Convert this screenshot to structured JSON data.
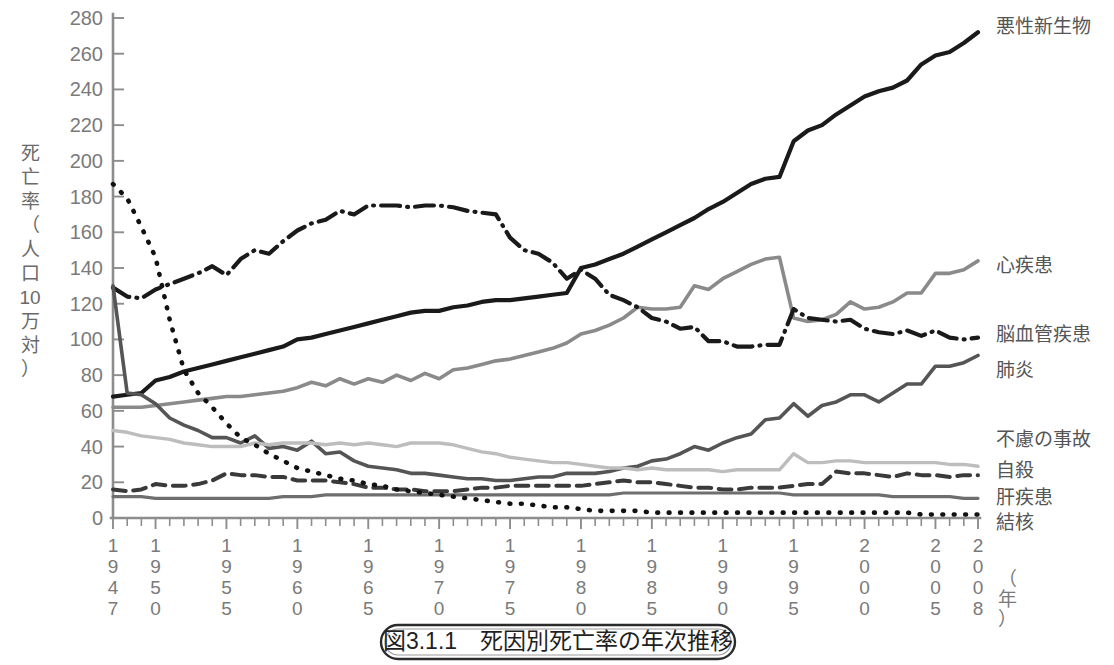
{
  "caption": "図3.1.1　死因別死亡率の年次推移",
  "axes": {
    "ylabel": "死亡率（人口10万対）",
    "ylabel_chars": [
      "死",
      "亡",
      "率",
      "（",
      "人",
      "口",
      "10",
      "万",
      "対",
      "）"
    ],
    "xlabel": "（年）",
    "ylim": [
      0,
      280
    ],
    "ytick_step": 20,
    "yticks": [
      "0",
      "20",
      "40",
      "60",
      "80",
      "100",
      "120",
      "140",
      "160",
      "180",
      "200",
      "220",
      "240",
      "260",
      "280"
    ],
    "xlim": [
      1947,
      2008
    ],
    "xticks": [
      "1947",
      "1950",
      "1955",
      "1960",
      "1965",
      "1970",
      "1975",
      "1980",
      "1985",
      "1990",
      "1995",
      "2000",
      "2005",
      "2008"
    ],
    "grid": false
  },
  "chart_data": {
    "type": "line",
    "title": "図3.1.1　死因別死亡率の年次推移",
    "xlabel": "（年）",
    "ylabel": "死亡率（人口10万対）",
    "xlim": [
      1947,
      2008
    ],
    "ylim": [
      0,
      280
    ],
    "legend_position": "right-inline",
    "x": [
      1947,
      1948,
      1949,
      1950,
      1951,
      1952,
      1953,
      1954,
      1955,
      1956,
      1957,
      1958,
      1959,
      1960,
      1961,
      1962,
      1963,
      1964,
      1965,
      1966,
      1967,
      1968,
      1969,
      1970,
      1971,
      1972,
      1973,
      1974,
      1975,
      1976,
      1977,
      1978,
      1979,
      1980,
      1981,
      1982,
      1983,
      1984,
      1985,
      1986,
      1987,
      1988,
      1989,
      1990,
      1991,
      1992,
      1993,
      1994,
      1995,
      1996,
      1997,
      1998,
      1999,
      2000,
      2001,
      2002,
      2003,
      2004,
      2005,
      2006,
      2007,
      2008
    ],
    "series": [
      {
        "name": "悪性新生物",
        "style": "solid",
        "color": "#1a1a1a",
        "width": 4.2,
        "values": [
          68,
          69,
          70,
          77,
          79,
          82,
          84,
          86,
          88,
          90,
          92,
          94,
          96,
          100,
          101,
          103,
          105,
          107,
          109,
          111,
          113,
          115,
          116,
          116,
          118,
          119,
          121,
          122,
          122,
          123,
          124,
          125,
          126,
          140,
          142,
          145,
          148,
          152,
          156,
          160,
          164,
          168,
          173,
          177,
          182,
          187,
          190,
          191,
          211,
          217,
          220,
          226,
          231,
          236,
          239,
          241,
          245,
          254,
          259,
          261,
          266,
          272
        ]
      },
      {
        "name": "心疾患",
        "style": "solid",
        "color": "#8a8a8a",
        "width": 3.6,
        "values": [
          62,
          62,
          62,
          63,
          64,
          65,
          66,
          67,
          68,
          68,
          69,
          70,
          71,
          73,
          76,
          74,
          78,
          75,
          78,
          76,
          80,
          77,
          81,
          78,
          83,
          84,
          86,
          88,
          89,
          91,
          93,
          95,
          98,
          103,
          105,
          108,
          112,
          118,
          117,
          117,
          118,
          130,
          128,
          134,
          138,
          142,
          145,
          146,
          112,
          110,
          111,
          114,
          121,
          117,
          118,
          121,
          126,
          126,
          137,
          137,
          139,
          144
        ]
      },
      {
        "name": "脳血管疾患",
        "style": "dashdot",
        "color": "#1a1a1a",
        "width": 4.2,
        "values": [
          129,
          124,
          123,
          128,
          131,
          134,
          137,
          141,
          136,
          145,
          150,
          148,
          155,
          161,
          165,
          167,
          172,
          170,
          175,
          175,
          175,
          174,
          175,
          175,
          174,
          172,
          171,
          170,
          157,
          150,
          148,
          143,
          134,
          139,
          134,
          125,
          122,
          118,
          112,
          110,
          106,
          107,
          99,
          99,
          96,
          96,
          97,
          97,
          117,
          112,
          111,
          110,
          111,
          106,
          104,
          103,
          105,
          102,
          105,
          101,
          100,
          101
        ]
      },
      {
        "name": "肺炎",
        "style": "solid",
        "color": "#555555",
        "width": 3.6,
        "values": [
          130,
          70,
          69,
          64,
          56,
          52,
          49,
          45,
          45,
          42,
          46,
          39,
          40,
          38,
          43,
          36,
          37,
          32,
          29,
          28,
          27,
          25,
          25,
          24,
          23,
          22,
          22,
          21,
          21,
          22,
          23,
          23,
          25,
          25,
          25,
          26,
          28,
          29,
          32,
          33,
          36,
          40,
          38,
          42,
          45,
          47,
          55,
          56,
          64,
          57,
          63,
          65,
          69,
          69,
          65,
          70,
          75,
          75,
          85,
          85,
          87,
          91
        ]
      },
      {
        "name": "不慮の事故",
        "style": "solid",
        "color": "#bdbdbd",
        "width": 3.4,
        "values": [
          49,
          48,
          46,
          45,
          44,
          42,
          41,
          40,
          40,
          40,
          42,
          41,
          42,
          42,
          42,
          41,
          42,
          41,
          42,
          41,
          40,
          42,
          42,
          42,
          41,
          39,
          37,
          36,
          34,
          33,
          32,
          31,
          31,
          30,
          29,
          28,
          28,
          27,
          28,
          27,
          27,
          27,
          27,
          26,
          27,
          27,
          27,
          27,
          36,
          31,
          31,
          32,
          32,
          31,
          31,
          31,
          31,
          31,
          31,
          30,
          30,
          29
        ]
      },
      {
        "name": "自殺",
        "style": "dashed",
        "color": "#3a3a3a",
        "width": 4.0,
        "values": [
          16,
          15,
          16,
          19,
          18,
          18,
          19,
          21,
          25,
          24,
          24,
          23,
          23,
          21,
          21,
          21,
          20,
          19,
          17,
          17,
          16,
          16,
          15,
          15,
          15,
          16,
          17,
          17,
          18,
          18,
          18,
          18,
          18,
          18,
          19,
          20,
          21,
          20,
          20,
          19,
          18,
          17,
          17,
          16,
          16,
          17,
          17,
          17,
          18,
          19,
          19,
          26,
          25,
          25,
          24,
          23,
          25,
          24,
          24,
          23,
          24,
          24
        ]
      },
      {
        "name": "肝疾患",
        "style": "solid",
        "color": "#6e6e6e",
        "width": 3.2,
        "values": [
          12,
          12,
          12,
          11,
          11,
          11,
          11,
          11,
          11,
          11,
          11,
          11,
          12,
          12,
          12,
          13,
          13,
          13,
          13,
          13,
          13,
          13,
          13,
          13,
          13,
          13,
          13,
          13,
          13,
          13,
          13,
          13,
          13,
          13,
          13,
          13,
          14,
          14,
          14,
          14,
          14,
          14,
          14,
          14,
          14,
          14,
          14,
          14,
          13,
          13,
          13,
          13,
          13,
          13,
          13,
          12,
          12,
          12,
          12,
          12,
          11,
          11
        ]
      },
      {
        "name": "結核",
        "style": "dotted",
        "color": "#111111",
        "width": 4.6,
        "values": [
          187,
          179,
          163,
          146,
          111,
          83,
          70,
          62,
          53,
          45,
          41,
          36,
          32,
          28,
          26,
          24,
          22,
          21,
          19,
          18,
          16,
          15,
          14,
          13,
          12,
          11,
          10,
          9,
          8,
          8,
          7,
          6,
          6,
          5,
          4,
          4,
          4,
          4,
          3,
          3,
          3,
          3,
          3,
          3,
          3,
          3,
          3,
          3,
          3,
          3,
          3,
          3,
          3,
          3,
          3,
          3,
          3,
          2,
          2,
          2,
          2,
          2
        ]
      }
    ],
    "annotations": [
      {
        "label": "悪性新生物",
        "at_year": 2008,
        "at_value": 272
      },
      {
        "label": "心疾患",
        "at_year": 2008,
        "at_value": 144
      },
      {
        "label": "脳血管疾患",
        "at_year": 2008,
        "at_value": 101
      },
      {
        "label": "肺炎",
        "at_year": 2008,
        "at_value": 91
      },
      {
        "label": "不慮の事故",
        "at_year": 2008,
        "at_value": 29
      },
      {
        "label": "自殺",
        "at_year": 2008,
        "at_value": 24
      },
      {
        "label": "肝疾患",
        "at_year": 2008,
        "at_value": 11
      },
      {
        "label": "結核",
        "at_year": 2008,
        "at_value": 2
      }
    ]
  },
  "legend_labels": [
    {
      "text": "悪性新生物",
      "y": 28
    },
    {
      "text": "心疾患",
      "y": 267
    },
    {
      "text": "脳血管疾患",
      "y": 336
    },
    {
      "text": "肺炎",
      "y": 372
    },
    {
      "text": "不慮の事故",
      "y": 441
    },
    {
      "text": "自殺",
      "y": 472
    },
    {
      "text": "肝疾患",
      "y": 499
    },
    {
      "text": "結核",
      "y": 524
    }
  ]
}
